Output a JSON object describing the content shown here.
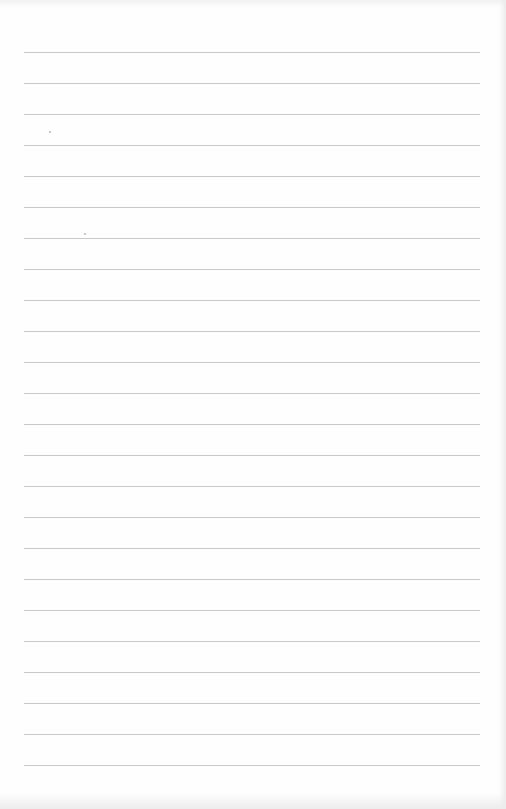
{
  "document": {
    "type": "lined-paper",
    "ruled_lines": {
      "count": 24,
      "first_y": 52,
      "spacing": 31,
      "left_x": 24,
      "right_x": 480,
      "color": "#c9c9c9"
    },
    "paper_color": "#fefefe",
    "specks": [
      {
        "x": 49,
        "y": 131
      },
      {
        "x": 84,
        "y": 233
      }
    ],
    "text": ""
  }
}
